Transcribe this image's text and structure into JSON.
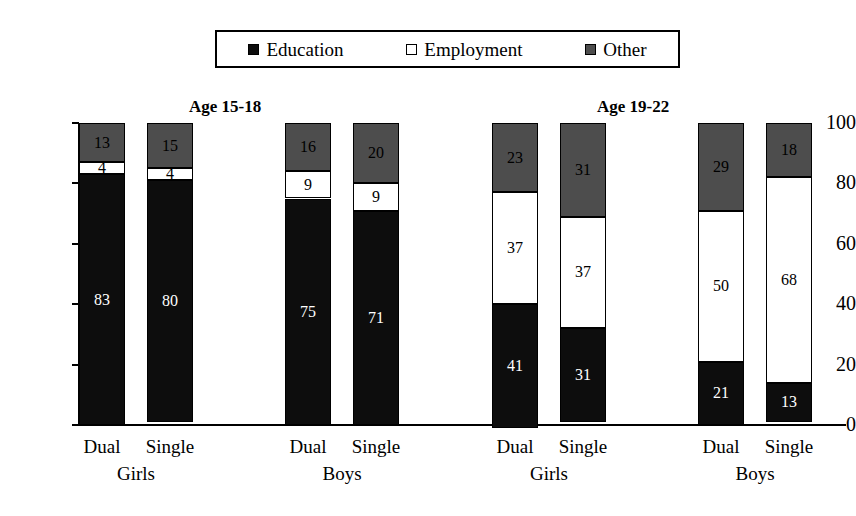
{
  "legend": {
    "entries": [
      {
        "label": "Education",
        "color": "#0d0d0d",
        "swatch": "filled-black-square-icon"
      },
      {
        "label": "Employment",
        "color": "#ffffff",
        "swatch": "open-white-square-icon"
      },
      {
        "label": "Other",
        "color": "#4d4d4d",
        "swatch": "filled-gray-square-icon"
      }
    ]
  },
  "titles": {
    "age_15_18": "Age 15-18",
    "age_19_22": "Age 19-22"
  },
  "axis": {
    "y_ticks": [
      "0",
      "20",
      "40",
      "60",
      "80",
      "100"
    ]
  },
  "categories": {
    "dual": "Dual",
    "single": "Single",
    "girls": "Girls",
    "boys": "Boys"
  },
  "chart_data": {
    "type": "bar",
    "title": "",
    "subtitle": "",
    "xlabel": "",
    "ylabel": "",
    "ylim": [
      0,
      100
    ],
    "yticks": [
      0,
      20,
      40,
      60,
      80,
      100
    ],
    "grid": false,
    "stacked": true,
    "legend_position": "top",
    "panels": [
      {
        "name": "Age 15-18",
        "groups": [
          "Girls",
          "Boys"
        ]
      },
      {
        "name": "Age 19-22",
        "groups": [
          "Girls",
          "Boys"
        ]
      }
    ],
    "categories": [
      "Age 15-18 / Girls / Dual",
      "Age 15-18 / Girls / Single",
      "Age 15-18 / Boys / Dual",
      "Age 15-18 / Boys / Single",
      "Age 19-22 / Girls / Dual",
      "Age 19-22 / Girls / Single",
      "Age 19-22 / Boys / Dual",
      "Age 19-22 / Boys / Single"
    ],
    "series": [
      {
        "name": "Education",
        "color": "#0d0d0d",
        "values": [
          83,
          80,
          75,
          71,
          41,
          31,
          21,
          13
        ]
      },
      {
        "name": "Employment",
        "color": "#ffffff",
        "values": [
          4,
          4,
          9,
          9,
          37,
          37,
          50,
          68
        ]
      },
      {
        "name": "Other",
        "color": "#4d4d4d",
        "values": [
          13,
          15,
          16,
          20,
          23,
          31,
          29,
          18
        ]
      }
    ]
  },
  "bars": [
    {
      "id": "b1",
      "x": 79,
      "education": "83",
      "employment": "4",
      "other": "13",
      "edu_v": 83,
      "emp_v": 4,
      "oth_v": 13
    },
    {
      "id": "b2",
      "x": 147,
      "education": "80",
      "employment": "4",
      "other": "15",
      "edu_v": 80,
      "emp_v": 4,
      "oth_v": 15
    },
    {
      "id": "b3",
      "x": 285,
      "education": "75",
      "employment": "9",
      "other": "16",
      "edu_v": 75,
      "emp_v": 9,
      "oth_v": 16
    },
    {
      "id": "b4",
      "x": 353,
      "education": "71",
      "employment": "9",
      "other": "20",
      "edu_v": 71,
      "emp_v": 9,
      "oth_v": 20
    },
    {
      "id": "b5",
      "x": 492,
      "education": "41",
      "employment": "37",
      "other": "23",
      "edu_v": 41,
      "emp_v": 37,
      "oth_v": 23
    },
    {
      "id": "b6",
      "x": 560,
      "education": "31",
      "employment": "37",
      "other": "31",
      "edu_v": 31,
      "emp_v": 37,
      "oth_v": 31
    },
    {
      "id": "b7",
      "x": 698,
      "education": "21",
      "employment": "50",
      "other": "29",
      "edu_v": 21,
      "emp_v": 50,
      "oth_v": 29
    },
    {
      "id": "b8",
      "x": 766,
      "education": "13",
      "employment": "68",
      "other": "18",
      "edu_v": 13,
      "emp_v": 68,
      "oth_v": 18
    }
  ],
  "cat_labels": [
    {
      "text": "Dual",
      "x": 62
    },
    {
      "text": "Single",
      "x": 130
    },
    {
      "text": "Dual",
      "x": 268
    },
    {
      "text": "Single",
      "x": 336
    },
    {
      "text": "Dual",
      "x": 475
    },
    {
      "text": "Single",
      "x": 543
    },
    {
      "text": "Dual",
      "x": 681
    },
    {
      "text": "Single",
      "x": 749
    }
  ],
  "group_labels": [
    {
      "text": "Girls",
      "x": 66
    },
    {
      "text": "Boys",
      "x": 272
    },
    {
      "text": "Girls",
      "x": 479
    },
    {
      "text": "Boys",
      "x": 685
    }
  ]
}
